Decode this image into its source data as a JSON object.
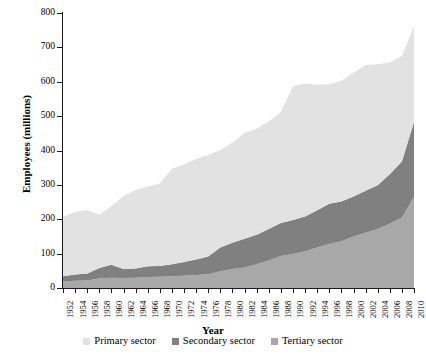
{
  "chart": {
    "type": "area",
    "title": "",
    "xlabel": "Year",
    "ylabel": "Employees (millions)"
  },
  "axes": {
    "y_ticks": [
      "0",
      "100",
      "200",
      "300",
      "400",
      "500",
      "600",
      "700",
      "800"
    ],
    "y_values": [
      0,
      100,
      200,
      300,
      400,
      500,
      600,
      700,
      800
    ],
    "ylim": [
      0,
      800
    ],
    "x_ticks": [
      "1952",
      "1954",
      "1956",
      "1958",
      "1960",
      "1962",
      "1964",
      "1966",
      "1968",
      "1970",
      "1972",
      "1974",
      "1976",
      "1978",
      "1980",
      "1982",
      "1984",
      "1986",
      "1988",
      "1990",
      "1992",
      "1994",
      "1996",
      "1998",
      "2000",
      "2002",
      "2004",
      "2006",
      "2008",
      "2010"
    ],
    "xlim": [
      1952,
      2010
    ],
    "grid": false
  },
  "legend": {
    "position": "bottom",
    "items": [
      {
        "label": "Primary sector",
        "color": "#e2e2e2"
      },
      {
        "label": "Secondary sector",
        "color": "#808080"
      },
      {
        "label": "Tertiary sector",
        "color": "#a8a8a8"
      }
    ]
  },
  "chart_data": {
    "type": "area",
    "stacked": true,
    "title": "",
    "xlabel": "Year",
    "ylabel": "Employees (millions)",
    "ylim": [
      0,
      800
    ],
    "grid": false,
    "legend_position": "bottom",
    "x": [
      1952,
      1954,
      1956,
      1958,
      1960,
      1962,
      1964,
      1966,
      1968,
      1970,
      1972,
      1974,
      1976,
      1978,
      1980,
      1982,
      1984,
      1986,
      1988,
      1990,
      1992,
      1994,
      1996,
      1998,
      2000,
      2002,
      2004,
      2006,
      2008,
      2010
    ],
    "stack_order": [
      "Tertiary sector",
      "Secondary sector",
      "Primary sector"
    ],
    "series": [
      {
        "name": "Tertiary sector",
        "color": "#a8a8a8",
        "values": [
          19,
          21,
          22,
          28,
          30,
          29,
          30,
          32,
          33,
          34,
          36,
          38,
          40,
          49,
          55,
          60,
          69,
          80,
          93,
          99,
          107,
          118,
          128,
          136,
          150,
          161,
          172,
          187,
          205,
          265
        ]
      },
      {
        "name": "Secondary sector",
        "color": "#808080",
        "values": [
          15,
          18,
          20,
          30,
          38,
          26,
          27,
          31,
          31,
          35,
          40,
          45,
          52,
          69,
          77,
          83,
          86,
          92,
          96,
          99,
          101,
          108,
          117,
          116,
          116,
          122,
          127,
          144,
          163,
          218
        ]
      },
      {
        "name": "Primary sector",
        "color": "#e2e2e2",
        "values": [
          173,
          183,
          185,
          155,
          170,
          213,
          228,
          232,
          240,
          278,
          283,
          292,
          295,
          283,
          291,
          308,
          308,
          313,
          323,
          389,
          387,
          366,
          348,
          351,
          360,
          366,
          352,
          325,
          307,
          279
        ]
      }
    ],
    "totals": [
      207,
      222,
      227,
      213,
      238,
      268,
      285,
      295,
      304,
      347,
      359,
      375,
      387,
      401,
      423,
      451,
      463,
      485,
      512,
      587,
      595,
      592,
      593,
      603,
      626,
      649,
      651,
      656,
      675,
      762
    ]
  }
}
